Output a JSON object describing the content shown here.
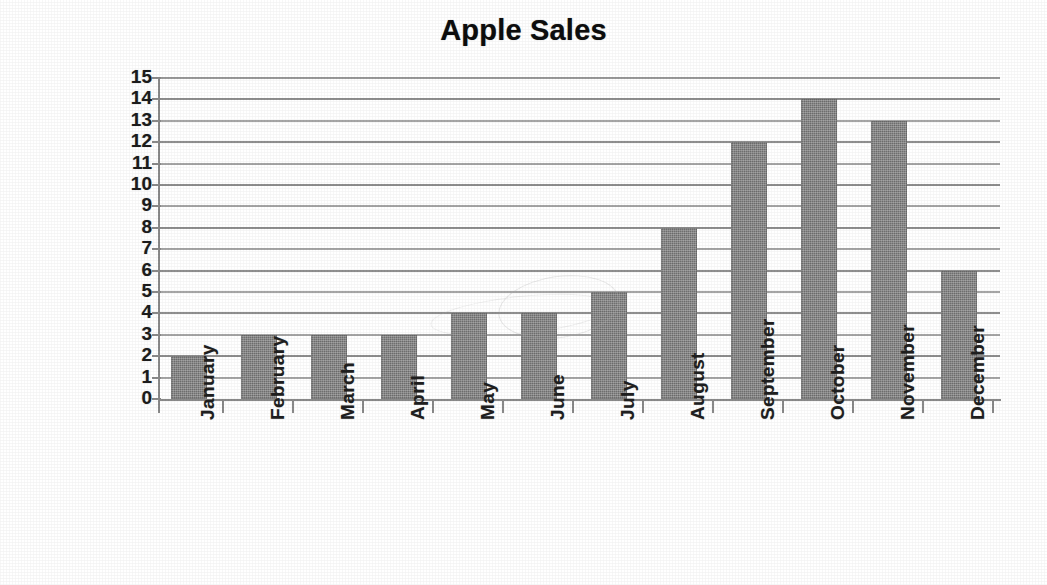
{
  "chart_data": {
    "type": "bar",
    "title": "Apple Sales",
    "xlabel": "",
    "ylabel": "Apples (tons)",
    "categories": [
      "January",
      "February",
      "March",
      "April",
      "May",
      "June",
      "July",
      "August",
      "September",
      "October",
      "November",
      "December"
    ],
    "values": [
      2,
      3,
      3,
      3,
      4,
      4,
      5,
      8,
      12,
      14,
      13,
      6
    ],
    "ylim": [
      0,
      15
    ],
    "ytick_labels": [
      "15",
      "14",
      "13",
      "12",
      "11",
      "10",
      "9",
      "8",
      "7",
      "6",
      "5",
      "4",
      "3",
      "2",
      "1",
      "0"
    ],
    "ytick_values": [
      15,
      14,
      13,
      12,
      11,
      10,
      9,
      8,
      7,
      6,
      5,
      4,
      3,
      2,
      1,
      0
    ],
    "grid": true,
    "grid_axis": "y",
    "legend": false,
    "legend_position": "none",
    "series": [
      {
        "name": "Apples (tons)",
        "values": [
          2,
          3,
          3,
          3,
          4,
          4,
          5,
          8,
          12,
          14,
          13,
          6
        ]
      }
    ]
  },
  "colors": {
    "bar": "#6f6f6f",
    "gridline": "#a6a6a6",
    "axis": "#8a8a8a",
    "text": "#1a1a1a",
    "background": "#ffffff"
  }
}
